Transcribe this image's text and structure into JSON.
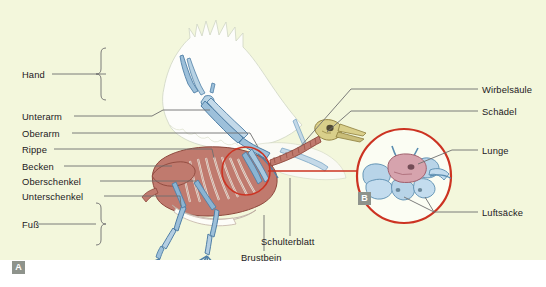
{
  "figure": {
    "background_color": "#f3f7dc",
    "page_color": "#ffffff"
  },
  "panels": [
    {
      "id": "A",
      "badge_label": "A",
      "description": "Ganzkörperansicht des Vogelskeletts"
    },
    {
      "id": "B",
      "badge_label": "B",
      "description": "Vergrößerter Ausschnitt: Lunge und Luftsäcke"
    }
  ],
  "labels_left": [
    {
      "id": "hand",
      "text": "Hand"
    },
    {
      "id": "unterarm",
      "text": "Unterarm"
    },
    {
      "id": "oberarm",
      "text": "Oberarm"
    },
    {
      "id": "rippe",
      "text": "Rippe"
    },
    {
      "id": "becken",
      "text": "Becken"
    },
    {
      "id": "oberschenkel",
      "text": "Oberschenkel"
    },
    {
      "id": "unterschenkel",
      "text": "Unterschenkel"
    },
    {
      "id": "fuss",
      "text": "Fuß"
    }
  ],
  "labels_right": [
    {
      "id": "wirbelsaeule",
      "text": "Wirbelsäule"
    },
    {
      "id": "schaedel",
      "text": "Schädel"
    },
    {
      "id": "lunge",
      "text": "Lunge"
    },
    {
      "id": "luftsaecke",
      "text": "Luftsäcke"
    }
  ],
  "labels_bottom": [
    {
      "id": "schulterblatt",
      "text": "Schulterblatt"
    },
    {
      "id": "brustbein",
      "text": "Brustbein"
    }
  ],
  "colors": {
    "background": "#f3f7dc",
    "bone_blue": "#9dc0da",
    "bone_blue_dk": "#5d8fb5",
    "body_red": "#c07a6e",
    "body_red_dk": "#a5564a",
    "skull_olive": "#d9cf8a",
    "lung_pink": "#d6a3ad",
    "airsac_blue": "#b8d4e8",
    "circle_red": "#cc3322",
    "leader_gray": "#6e6e6e",
    "feather_white": "#fdfdfb",
    "badge_gray": "#8e938c",
    "text": "#23201d"
  },
  "icons": {
    "panel_a_badge": "letter-a-badge",
    "panel_b_badge": "letter-b-badge",
    "magnifier_circle": "detail-circle-icon"
  }
}
